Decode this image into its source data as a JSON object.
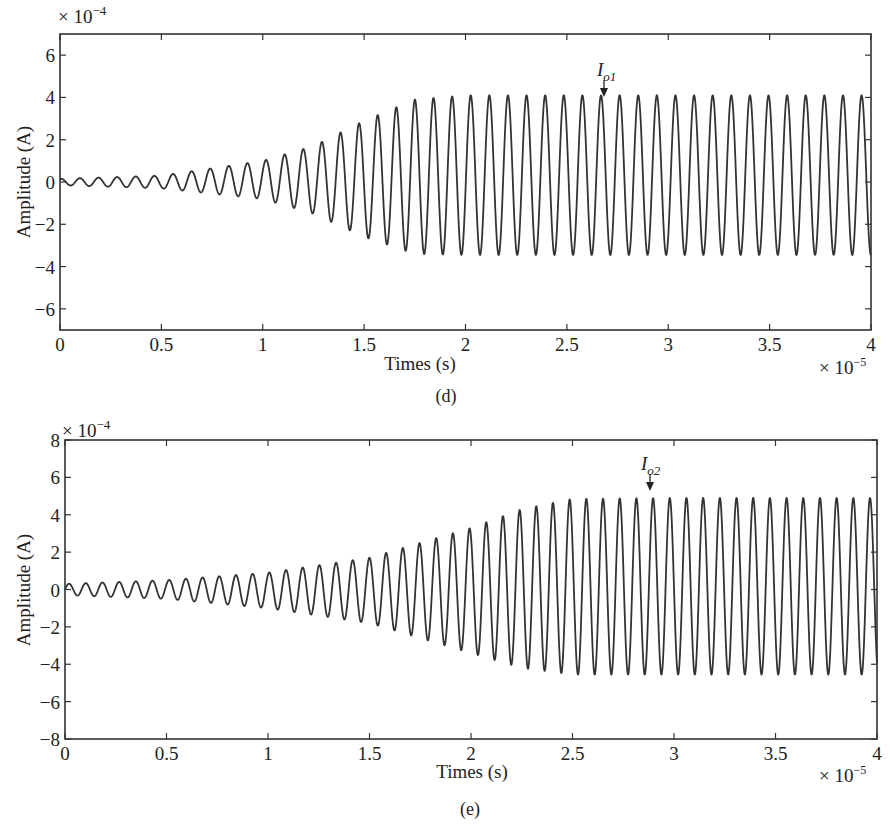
{
  "chart_data": [
    {
      "type": "line",
      "panel": "(d)",
      "title": "",
      "xlabel": "Times (s)",
      "ylabel": "Amplitude (A)",
      "x_multiplier": "× 10^-5",
      "y_multiplier": "× 10^-4",
      "xlim": [
        0,
        4
      ],
      "ylim": [
        -7,
        7
      ],
      "xticks": [
        0,
        0.5,
        1,
        1.5,
        2,
        2.5,
        3,
        3.5,
        4
      ],
      "yticks": [
        -6,
        -4,
        -2,
        0,
        2,
        4,
        6
      ],
      "grid": false,
      "annotation": {
        "text": "I",
        "sub": "o1",
        "x": 2.69,
        "y": 4.1
      },
      "signal": {
        "period": 0.0918,
        "phase_peak": 0.098,
        "growth_start": 0.0,
        "growth_end": 1.85,
        "a0": 0.15,
        "a_max_pos": 4.1,
        "a_max_neg": 3.45,
        "offset_final": 0.3,
        "growth_shape": "exponential-like ramp then steady"
      },
      "series": [
        {
          "name": "Io1",
          "x": [
            0,
            0.5,
            1.0,
            1.25,
            1.5,
            1.75,
            2.0,
            2.5,
            3.0,
            3.5,
            4.0
          ],
          "envelope_peak": [
            0.15,
            0.3,
            1.0,
            1.7,
            2.9,
            3.9,
            4.1,
            4.1,
            4.1,
            4.1,
            4.1
          ],
          "envelope_trough": [
            -0.15,
            -0.3,
            -0.8,
            -1.5,
            -2.6,
            -3.4,
            -3.45,
            -3.45,
            -3.45,
            -3.45,
            -3.45
          ]
        }
      ]
    },
    {
      "type": "line",
      "panel": "(e)",
      "title": "",
      "xlabel": "Times (s)",
      "ylabel": "Amplitude (A)",
      "x_multiplier": "× 10^-5",
      "y_multiplier": "× 10^-4",
      "xlim": [
        0,
        4
      ],
      "ylim": [
        -8,
        8
      ],
      "xticks": [
        0,
        0.5,
        1,
        1.5,
        2,
        2.5,
        3,
        3.5,
        4
      ],
      "yticks": [
        -8,
        -6,
        -4,
        -2,
        0,
        2,
        4,
        6,
        8
      ],
      "grid": false,
      "annotation": {
        "text": "I",
        "sub": "o2",
        "x": 2.9,
        "y": 4.9
      },
      "signal": {
        "period": 0.0822,
        "phase_peak": 0.02,
        "growth_start": 0.0,
        "growth_end": 2.4,
        "a0": 0.3,
        "a_max_pos": 4.9,
        "a_max_neg": 4.55,
        "offset_final": 0.17,
        "growth_shape": "exponential-like ramp then steady"
      },
      "series": [
        {
          "name": "Io2",
          "x": [
            0,
            0.5,
            1.0,
            1.5,
            2.0,
            2.25,
            2.5,
            3.0,
            3.5,
            4.0
          ],
          "envelope_peak": [
            0.3,
            0.5,
            0.9,
            1.7,
            3.3,
            4.3,
            4.85,
            4.9,
            4.9,
            4.9
          ],
          "envelope_trough": [
            -0.3,
            -0.5,
            -1.0,
            -1.8,
            -3.4,
            -4.2,
            -4.55,
            -4.55,
            -4.55,
            -4.55
          ]
        }
      ]
    }
  ],
  "panels": {
    "top": {
      "caption": "(d)",
      "xlabel": "Times (s)",
      "ylabel": "Amplitude (A)",
      "xmult": "× 10",
      "xmult_exp": "−5",
      "ymult": "× 10",
      "ymult_exp": "−4",
      "ann_main": "I",
      "ann_sub": "o1"
    },
    "bottom": {
      "caption": "(e)",
      "xlabel": "Times (s)",
      "ylabel": "Amplitude (A)",
      "xmult": "× 10",
      "xmult_exp": "−5",
      "ymult": "× 10",
      "ymult_exp": "−4",
      "ann_main": "I",
      "ann_sub": "o2"
    }
  },
  "colors": {
    "line": "#333333",
    "axis": "#333333",
    "text": "#222222"
  }
}
